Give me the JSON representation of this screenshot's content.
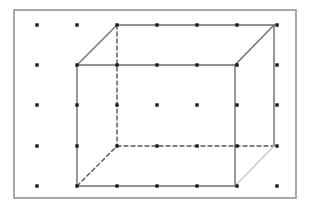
{
  "figure": {
    "kind": "geometric-dot-lattice-diagram",
    "canvas": {
      "width": 311,
      "height": 212,
      "background": "#ffffff"
    },
    "frame": {
      "name": "outer-border",
      "x": 14,
      "y": 10,
      "width": 282,
      "height": 188,
      "stroke": "#a8a8a8",
      "stroke_width": 2,
      "fill": "#ffffff"
    },
    "lattice": {
      "columns": 7,
      "rows": 5,
      "spacing_x": 40,
      "spacing_y": 40,
      "origin_x": 37,
      "origin_y": 25,
      "dot_size": 3.4,
      "dot_color": "#1a1a1a",
      "dot_shape": "square",
      "xs": [
        37,
        77,
        117,
        157,
        197,
        237,
        277
      ],
      "ys": [
        25,
        65,
        105,
        146,
        186
      ]
    },
    "cube": {
      "description": "Unit cube in oblique/cabinet projection; front face solid, hidden back edges dashed",
      "vertices": {
        "front_top_left": [
          77,
          65
        ],
        "front_top_right": [
          235,
          65
        ],
        "front_bottom_left": [
          77,
          186
        ],
        "front_bottom_right": [
          235,
          186
        ],
        "back_top_left": [
          117,
          25
        ],
        "back_top_right": [
          274,
          25
        ],
        "back_bottom_left": [
          117,
          146
        ],
        "back_bottom_right": [
          274,
          146
        ]
      },
      "edges": [
        {
          "name": "front-top",
          "from": "front_top_left",
          "to": "front_top_right",
          "style": "solid",
          "color": "#6e6e6e"
        },
        {
          "name": "front-bottom",
          "from": "front_bottom_left",
          "to": "front_bottom_right",
          "style": "solid",
          "color": "#6e6e6e"
        },
        {
          "name": "front-left",
          "from": "front_top_left",
          "to": "front_bottom_left",
          "style": "solid",
          "color": "#6e6e6e"
        },
        {
          "name": "front-right",
          "from": "front_top_right",
          "to": "front_bottom_right",
          "style": "solid",
          "color": "#6e6e6e"
        },
        {
          "name": "back-top",
          "from": "back_top_left",
          "to": "back_top_right",
          "style": "solid",
          "color": "#6e6e6e"
        },
        {
          "name": "back-right",
          "from": "back_top_right",
          "to": "back_bottom_right",
          "style": "solid",
          "color": "#6e6e6e"
        },
        {
          "name": "back-bottom",
          "from": "back_bottom_left",
          "to": "back_bottom_right",
          "style": "dashed",
          "color": "#555555"
        },
        {
          "name": "back-left",
          "from": "back_top_left",
          "to": "back_bottom_left",
          "style": "dashed",
          "color": "#555555"
        },
        {
          "name": "diagonal-top-left",
          "from": "front_top_left",
          "to": "back_top_left",
          "style": "solid",
          "color": "#6e6e6e"
        },
        {
          "name": "diagonal-top-right",
          "from": "front_top_right",
          "to": "back_top_right",
          "style": "solid",
          "color": "#6e6e6e"
        },
        {
          "name": "diagonal-bottom-left",
          "from": "front_bottom_left",
          "to": "back_bottom_left",
          "style": "dashed",
          "color": "#555555"
        },
        {
          "name": "diagonal-bottom-right",
          "from": "front_bottom_right",
          "to": "back_bottom_right",
          "style": "solid",
          "color": "#c9c9c9"
        }
      ],
      "stroke_width": 1.4,
      "dash_pattern": "4,3"
    }
  }
}
